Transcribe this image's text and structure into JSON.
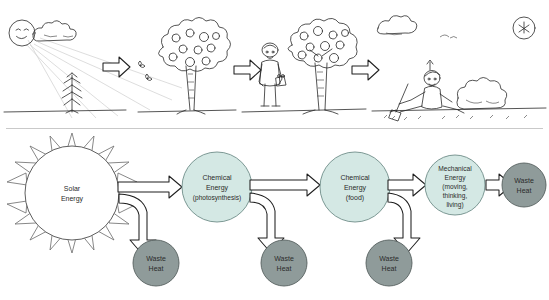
{
  "diagram": {
    "colors": {
      "energy_fill": "#d4e8e4",
      "energy_stroke": "#6f8d89",
      "waste_fill": "#8f9b9a",
      "waste_stroke": "#56605f",
      "sun_fill": "#ffffff",
      "sun_stroke": "#6a6a6a",
      "arrow_fill": "#ffffff",
      "arrow_stroke": "#1f1f1f",
      "text": "#2b2b2b"
    },
    "nodes": [
      {
        "id": "solar",
        "type": "sun",
        "label_lines": [
          "Solar",
          "Energy"
        ]
      },
      {
        "id": "chem_photo",
        "type": "energy",
        "label_lines": [
          "Chemical",
          "Energy",
          "(photosynthesis)"
        ]
      },
      {
        "id": "chem_food",
        "type": "energy",
        "label_lines": [
          "Chemical",
          "Energy",
          "(food)"
        ]
      },
      {
        "id": "mechanical",
        "type": "energy",
        "label_lines": [
          "Mechanical",
          "Energy",
          "(moving,",
          "thinking,",
          "living)"
        ]
      },
      {
        "id": "waste1",
        "type": "waste",
        "label_lines": [
          "Waste",
          "Heat"
        ]
      },
      {
        "id": "waste2",
        "type": "waste",
        "label_lines": [
          "Waste",
          "Heat"
        ]
      },
      {
        "id": "waste3",
        "type": "waste",
        "label_lines": [
          "Waste",
          "Heat"
        ]
      },
      {
        "id": "waste4",
        "type": "waste",
        "label_lines": [
          "Waste",
          "Heat"
        ]
      }
    ],
    "flow_sequence": [
      "Solar Energy",
      "Chemical Energy (photosynthesis)",
      "Chemical Energy (food)",
      "Mechanical Energy (moving, thinking, living)",
      "Waste Heat"
    ],
    "waste_branches": 3
  },
  "illustration": {
    "scenes": [
      {
        "id": "scene-1",
        "caption": "Sun with face, clouds, sunbeams and a young sapling"
      },
      {
        "id": "scene-2",
        "caption": "Mature tree bearing apples with butterflies"
      },
      {
        "id": "scene-3",
        "caption": "Farmer holding a basket beside an apple tree"
      },
      {
        "id": "scene-4",
        "caption": "Person resting on the ground after work with shovel and bush"
      }
    ],
    "arrow_count": 3
  }
}
